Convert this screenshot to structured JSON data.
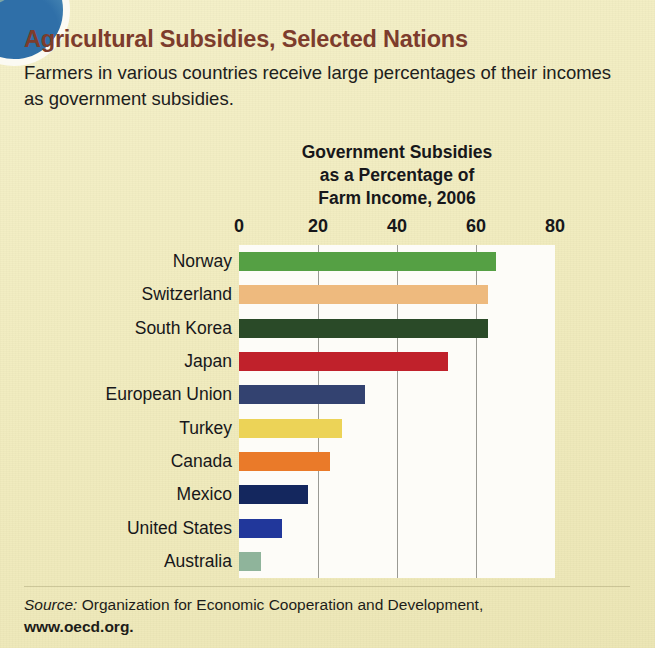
{
  "article": {
    "headline": "Agricultural Subsidies, Selected Nations",
    "deck": "Farmers in various countries receive large percentages of their incomes as government subsidies."
  },
  "decor": {
    "corner_badge_icon": "circle-photo-badge"
  },
  "source": {
    "label": "Source:",
    "text": " Organization for Economic Cooperation and Development,",
    "url": "www.oecd.org."
  },
  "chart_data": {
    "type": "bar",
    "orientation": "horizontal",
    "title_lines": [
      "Government Subsidies",
      "as a Percentage of",
      "Farm Income, 2006"
    ],
    "xlabel": "",
    "ylabel": "",
    "xlim": [
      0,
      80
    ],
    "ticks": [
      0,
      20,
      40,
      60,
      80
    ],
    "tick_labels": [
      "0",
      "20",
      "40",
      "60",
      "80"
    ],
    "gridlines": [
      20,
      40,
      60
    ],
    "grid": true,
    "legend": "none",
    "categories": [
      "Norway",
      "Switzerland",
      "South Korea",
      "Japan",
      "European Union",
      "Turkey",
      "Canada",
      "Mexico",
      "United States",
      "Australia"
    ],
    "values": [
      65,
      63,
      63,
      53,
      32,
      26,
      23,
      17.5,
      11,
      5.5
    ],
    "bar_colors": [
      "#55a044",
      "#eeba7e",
      "#2a4a28",
      "#c0212b",
      "#334270",
      "#ecd357",
      "#ea7a29",
      "#14275e",
      "#21379b",
      "#8fb49b"
    ],
    "series": [
      {
        "name": "Government subsidies as a percentage of farm income, 2006",
        "values": [
          65,
          63,
          63,
          53,
          32,
          26,
          23,
          17.5,
          11,
          5.5
        ]
      }
    ]
  }
}
